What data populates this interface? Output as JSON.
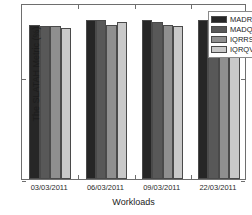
{
  "chart_data": {
    "type": "bar",
    "title": "",
    "xlabel": "Workloads",
    "ylabel": "The SLATAH Metric (%)",
    "categories": [
      "03/03/2011",
      "06/03/2011",
      "09/03/2011",
      "22/03/2011"
    ],
    "series": [
      {
        "name": "MADRS",
        "color": "#262626",
        "values": [
          7.55,
          7.75,
          7.75,
          7.75
        ]
      },
      {
        "name": "MADQVF",
        "color": "#585858",
        "values": [
          7.5,
          7.78,
          7.65,
          7.7
        ]
      },
      {
        "name": "IQRRS",
        "color": "#8f8f8f",
        "values": [
          7.48,
          7.55,
          7.55,
          7.55
        ]
      },
      {
        "name": "IQRQVF",
        "color": "#c9c9c9",
        "values": [
          7.4,
          7.65,
          7.5,
          7.6
        ]
      }
    ],
    "ylim": [
      0,
      8.6
    ],
    "yticks": [
      0,
      5
    ],
    "ytick_labels": [
      "0",
      "5"
    ],
    "grid": false,
    "legend_position": "top-right"
  },
  "legend": {
    "entries": [
      {
        "label": "MADRS"
      },
      {
        "label": "MADQVF"
      },
      {
        "label": "IQRRS"
      },
      {
        "label": "IQRQVF"
      }
    ]
  }
}
